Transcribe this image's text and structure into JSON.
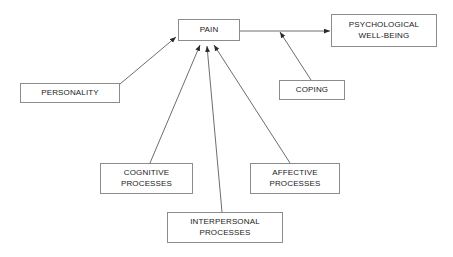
{
  "diagram": {
    "background_color": "#ffffff",
    "box_border_color": "#8c8c8c",
    "edge_color": "#6e6e6e",
    "text_color": "#1a1a1a",
    "nodes": [
      {
        "id": "pain",
        "label_line1": "PAIN",
        "label_line2": "",
        "x": 178,
        "y": 19,
        "w": 62,
        "h": 22
      },
      {
        "id": "psychological-well-being",
        "label_line1": "PSYCHOLOGICAL",
        "label_line2": "WELL-BEING",
        "x": 331,
        "y": 14,
        "w": 106,
        "h": 33
      },
      {
        "id": "personality",
        "label_line1": "PERSONALITY",
        "label_line2": "",
        "x": 20,
        "y": 83,
        "w": 100,
        "h": 20
      },
      {
        "id": "coping",
        "label_line1": "COPING",
        "label_line2": "",
        "x": 279,
        "y": 80,
        "w": 66,
        "h": 20
      },
      {
        "id": "cognitive-processes",
        "label_line1": "COGNITIVE",
        "label_line2": "PROCESSES",
        "x": 100,
        "y": 163,
        "w": 93,
        "h": 31
      },
      {
        "id": "affective-processes",
        "label_line1": "AFFECTIVE",
        "label_line2": "PROCESSES",
        "x": 250,
        "y": 163,
        "w": 90,
        "h": 31
      },
      {
        "id": "interpersonal-processes",
        "label_line1": "INTERPERSONAL",
        "label_line2": "PROCESSES",
        "x": 167,
        "y": 212,
        "w": 116,
        "h": 31
      }
    ],
    "edges": [
      {
        "id": "personality-to-pain",
        "from": "personality",
        "to": "pain",
        "x1": 120,
        "y1": 84,
        "x2": 176,
        "y2": 37
      },
      {
        "id": "pain-to-well-being",
        "from": "pain",
        "to": "psychological-well-being",
        "x1": 240,
        "y1": 31,
        "x2": 330,
        "y2": 31
      },
      {
        "id": "coping-to-pain-well-being-link",
        "from": "coping",
        "to": "pain-to-well-being",
        "x1": 311,
        "y1": 80,
        "x2": 279,
        "y2": 31
      },
      {
        "id": "cognitive-to-pain",
        "from": "cognitive-processes",
        "to": "pain",
        "x1": 150,
        "y1": 163,
        "x2": 200,
        "y2": 44
      },
      {
        "id": "interpersonal-to-pain",
        "from": "interpersonal-processes",
        "to": "pain",
        "x1": 222,
        "y1": 212,
        "x2": 207,
        "y2": 45
      },
      {
        "id": "affective-to-pain",
        "from": "affective-processes",
        "to": "pain",
        "x1": 290,
        "y1": 163,
        "x2": 214,
        "y2": 44
      }
    ]
  }
}
